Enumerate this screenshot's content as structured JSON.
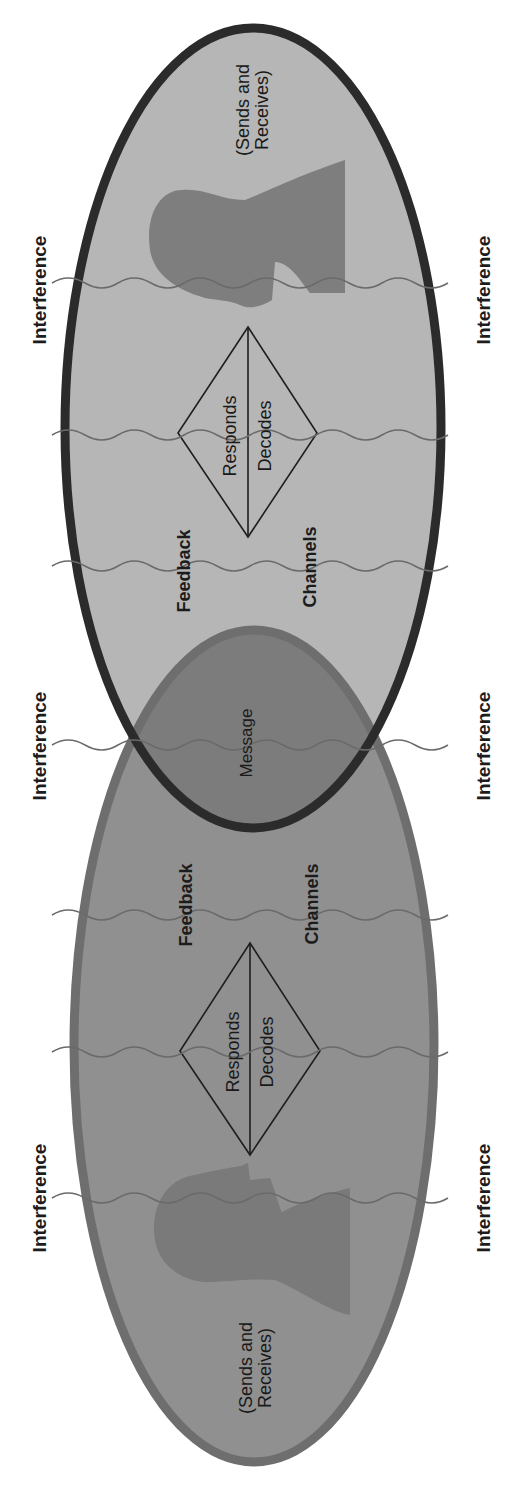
{
  "figure": {
    "colors": {
      "background": "#ffffff",
      "top_ellipse_fill": "#b6b6b6",
      "top_ellipse_stroke": "#2b2b2b",
      "bottom_ellipse_fill": "#909090",
      "bottom_ellipse_stroke": "#6e6e6e",
      "overlap_fill": "#7c7c7c",
      "head_silhouette": "#7e7e7e",
      "wave_line": "#6a6a6a",
      "text": "#1c1c1c"
    },
    "interference_label": "Interference",
    "interference_rows": [
      {
        "y": 290,
        "left_label": "Interference",
        "right_label": "Interference"
      },
      {
        "y": 745,
        "left_label": "Interference",
        "right_label": "Interference"
      },
      {
        "y": 1196,
        "left_label": "Interference",
        "right_label": "Interference"
      }
    ],
    "top_person": {
      "role": "(Sends and Receives)",
      "role_line1": "(Sends and",
      "role_line2": "Receives)",
      "diamond": {
        "left": "Responds",
        "right": "Decodes"
      },
      "feedback_label": "Feedback",
      "channels_label": "Channels"
    },
    "overlap": {
      "label": "Message"
    },
    "bottom_person": {
      "role": "(Sends and Receives)",
      "role_line1": "(Sends and",
      "role_line2": "Receives)",
      "diamond": {
        "left": "Responds",
        "right": "Decodes"
      },
      "feedback_label": "Feedback",
      "channels_label": "Channels"
    },
    "wave_y_positions": [
      283,
      435,
      566,
      745,
      915,
      1052,
      1198
    ]
  }
}
